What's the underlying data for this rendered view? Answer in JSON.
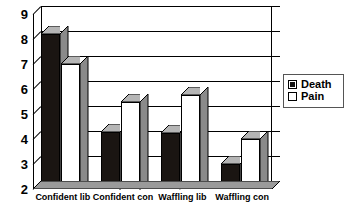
{
  "chart_data": {
    "type": "bar",
    "title": "",
    "subtitle": "",
    "xlabel": "",
    "ylabel": "",
    "ylim": [
      2,
      9
    ],
    "ytick_values": [
      9,
      8,
      7,
      6,
      5,
      4,
      3,
      2
    ],
    "ytick_labels": [
      "9",
      "8",
      "7",
      "6",
      "5",
      "4",
      "3",
      "2"
    ],
    "grid": true,
    "grid_axis": "y",
    "legend_position": "right",
    "style": "3d-clustered-column",
    "categories": [
      "Confident lib",
      "Confident con",
      "Waffling lib",
      "Waffling con"
    ],
    "series": [
      {
        "name": "Death",
        "color": "#1a1512",
        "fill": "solid-black",
        "values": [
          8.2,
          4.3,
          4.25,
          3.0
        ]
      },
      {
        "name": "Pain",
        "color": "#ffffff",
        "fill": "white-outline",
        "values": [
          7.0,
          5.5,
          5.75,
          4.0
        ]
      }
    ]
  },
  "legend": {
    "entries": [
      {
        "label": "Death",
        "swatch": "filled-black-square"
      },
      {
        "label": "Pain",
        "swatch": "empty-white-square"
      }
    ]
  },
  "colors": {
    "axis": "#000000",
    "gridline": "#000000",
    "bar_death": "#1a1512",
    "bar_pain": "#ffffff",
    "bar_top_shade": "#b5b5b5",
    "bar_side_shade": "#8a8a8a",
    "floor_shade": "#9a9a9a",
    "legend_border": "#555555",
    "background": "#ffffff"
  }
}
